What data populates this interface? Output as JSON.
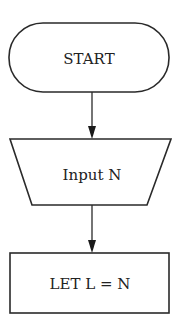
{
  "flowchart": {
    "nodes": [
      {
        "id": "start",
        "shape": "terminal",
        "label": "START"
      },
      {
        "id": "input",
        "shape": "manual-input-trapezoid",
        "label": "Input N"
      },
      {
        "id": "let",
        "shape": "process-rectangle",
        "label": "LET L = N"
      }
    ],
    "edges": [
      {
        "from": "start",
        "to": "input"
      },
      {
        "from": "input",
        "to": "let"
      }
    ]
  },
  "colors": {
    "stroke": "#2a2a2a",
    "background": "#ffffff"
  }
}
